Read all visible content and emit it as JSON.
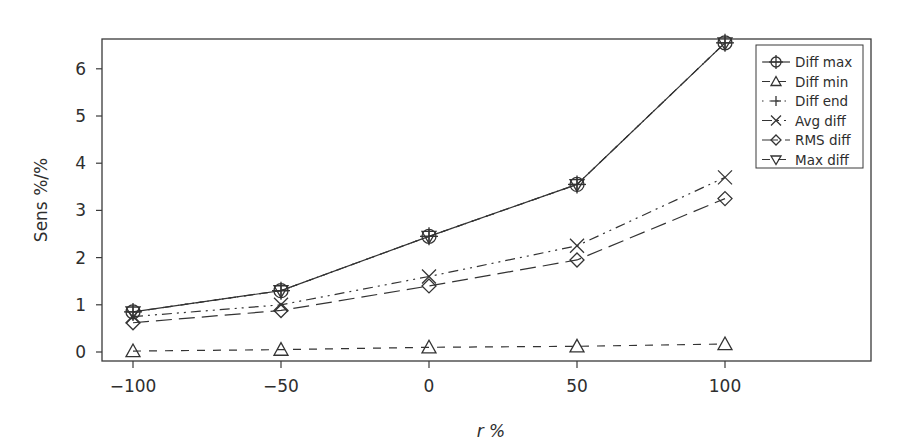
{
  "chart_data": {
    "type": "line",
    "title": "",
    "xlabel": "r %",
    "ylabel": "Sens %/%",
    "x": [
      -100,
      -50,
      0,
      50,
      100
    ],
    "xticks": [
      "-100",
      "-50",
      "0",
      "50",
      "100"
    ],
    "yticks": [
      "0",
      "1",
      "2",
      "3",
      "4",
      "5",
      "6"
    ],
    "xlim": [
      -110,
      145
    ],
    "ylim": [
      -0.2,
      6.7
    ],
    "grid": false,
    "legend_position": "upper right (inside)",
    "series": [
      {
        "name": "Diff max",
        "marker": "circle-plus",
        "line": "solid",
        "values": [
          0.85,
          1.3,
          2.45,
          3.55,
          6.55
        ]
      },
      {
        "name": "Diff min",
        "marker": "triangle-up",
        "line": "dashed",
        "values": [
          0.02,
          0.05,
          0.1,
          0.12,
          0.17
        ]
      },
      {
        "name": "Diff end",
        "marker": "plus",
        "line": "dotted",
        "values": [
          0.85,
          1.3,
          2.45,
          3.55,
          6.55
        ]
      },
      {
        "name": "Avg diff",
        "marker": "x",
        "line": "dash-dot-dot",
        "values": [
          0.75,
          1.0,
          1.6,
          2.25,
          3.7
        ]
      },
      {
        "name": "RMS diff",
        "marker": "diamond",
        "line": "long-dash",
        "values": [
          0.62,
          0.88,
          1.4,
          1.95,
          3.25
        ]
      },
      {
        "name": "Max diff",
        "marker": "triangle-down",
        "line": "dashed",
        "values": [
          0.85,
          1.3,
          2.45,
          3.55,
          6.55
        ]
      }
    ]
  }
}
